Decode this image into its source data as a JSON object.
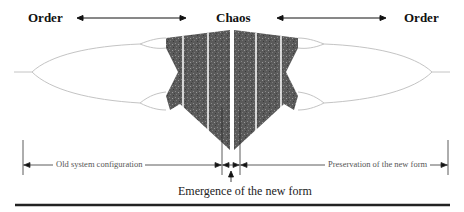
{
  "diagram": {
    "type": "bifurcation-diagram",
    "top_labels": {
      "left": "Order",
      "center": "Chaos",
      "right": "Order"
    },
    "regions": {
      "left": "Old system configuration",
      "middle": "Emergence of the new form",
      "right": "Preservation of the new form"
    },
    "colors": {
      "chaos_fill": "#555555",
      "branch_line": "#bbbbbb",
      "ink": "#111111",
      "rule": "#222222"
    }
  }
}
